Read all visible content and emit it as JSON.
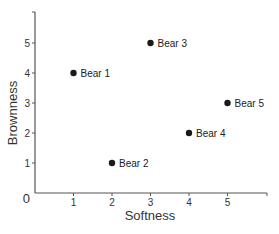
{
  "chart_data": {
    "type": "scatter",
    "title": "",
    "xlabel": "Softness",
    "ylabel": "Brownness",
    "origin_label": "0",
    "xlim": [
      0,
      6
    ],
    "ylim": [
      0,
      6
    ],
    "x_ticks": [
      "1",
      "2",
      "3",
      "4",
      "5"
    ],
    "y_ticks": [
      "1",
      "2",
      "3",
      "4",
      "5"
    ],
    "grid": false,
    "legend": null,
    "points": [
      {
        "label": "Bear 1",
        "x": 1,
        "y": 4
      },
      {
        "label": "Bear 2",
        "x": 2,
        "y": 1
      },
      {
        "label": "Bear 3",
        "x": 3,
        "y": 5
      },
      {
        "label": "Bear 4",
        "x": 4,
        "y": 2
      },
      {
        "label": "Bear 5",
        "x": 5,
        "y": 3
      }
    ],
    "colors": {
      "axis": "#555555",
      "point": "#1a1a1a",
      "text": "#333333"
    }
  }
}
